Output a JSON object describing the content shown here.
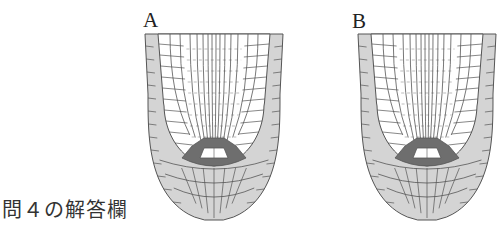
{
  "figure": {
    "answer_label": "問４の解答欄",
    "panels": [
      {
        "label": "A",
        "label_x": 143,
        "label_y": 10,
        "root_x": 145,
        "root_y": 34
      },
      {
        "label": "B",
        "label_x": 352,
        "label_y": 11,
        "root_x": 358,
        "root_y": 34
      }
    ],
    "colors": {
      "outline": "#555555",
      "cap": "#d4d4d4",
      "epidermis": "#cfcfcf",
      "stem_cell_niche": "#6e6e6e",
      "quiescent_center": "#ffffff",
      "interior": "#ffffff"
    }
  }
}
